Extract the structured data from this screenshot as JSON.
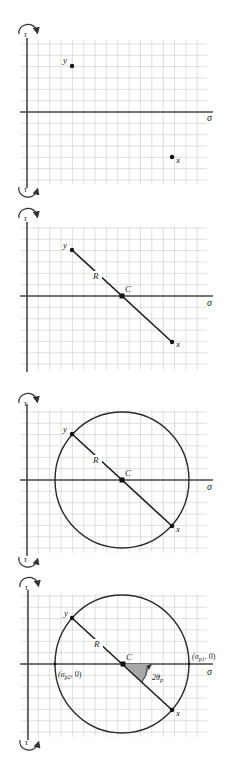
{
  "figure": {
    "colors": {
      "grid": "#c9c9c9",
      "axis": "#4a4a4a",
      "line": "#1e1e1e",
      "angle_fill": "#a8a8a8"
    },
    "panels": [
      {
        "id": "step-1",
        "axis_labels": {
          "horizontal": "σ",
          "vertical_top": "τ",
          "vertical_bottom": "τ"
        },
        "points": [
          {
            "label": "y"
          },
          {
            "label": "x"
          }
        ]
      },
      {
        "id": "step-2",
        "axis_labels": {
          "horizontal": "σ",
          "vertical_top": "τ",
          "vertical_bottom": "τ"
        },
        "points": [
          {
            "label": "y"
          },
          {
            "label": "x"
          }
        ],
        "center_label": "C",
        "radius_label": "R"
      },
      {
        "id": "step-3",
        "axis_labels": {
          "horizontal": "σ",
          "vertical_top": "τ",
          "vertical_bottom": "τ"
        },
        "points": [
          {
            "label": "y"
          },
          {
            "label": "x"
          }
        ],
        "center_label": "C",
        "radius_label": "R"
      },
      {
        "id": "step-4",
        "axis_labels": {
          "horizontal": "σ",
          "vertical_top": "τ",
          "vertical_bottom": "τ"
        },
        "points": [
          {
            "label": "y"
          },
          {
            "label": "x"
          }
        ],
        "center_label": "C",
        "radius_label": "R",
        "principal_1": {
          "sym": "σ",
          "sub": "p1",
          "suffix": ", 0)",
          "prefix": "("
        },
        "principal_2": {
          "sym": "σ",
          "sub": "p2",
          "suffix": ", 0)",
          "prefix": "("
        },
        "angle": {
          "num": "2θ",
          "sub": "p"
        }
      }
    ]
  }
}
